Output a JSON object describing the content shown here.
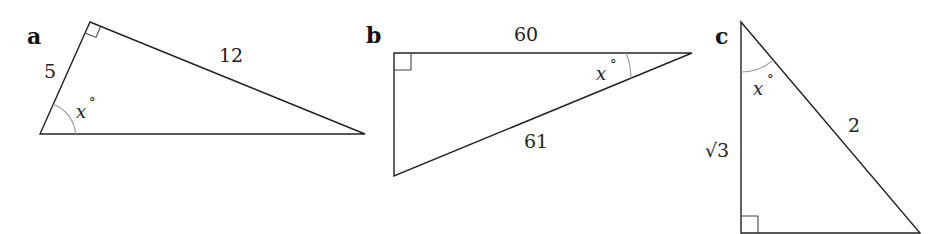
{
  "figure": {
    "panels": [
      {
        "id": "a",
        "label": "a",
        "sides": {
          "adjacent": "5",
          "opposite": "12"
        },
        "angle_label": "x",
        "degree_symbol": "°"
      },
      {
        "id": "b",
        "label": "b",
        "sides": {
          "adjacent": "60",
          "hypotenuse": "61"
        },
        "angle_label": "x",
        "degree_symbol": "°"
      },
      {
        "id": "c",
        "label": "c",
        "sides": {
          "adjacent": "√3",
          "hypotenuse": "2"
        },
        "angle_label": "x",
        "degree_symbol": "°"
      }
    ],
    "colors": {
      "stroke": "#222222",
      "right_angle_marker": "#444444",
      "angle_arc": "#999999",
      "background": "#ffffff"
    }
  }
}
